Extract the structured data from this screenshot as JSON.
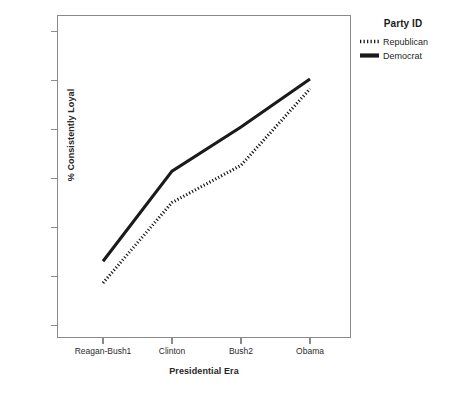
{
  "chart_data": {
    "type": "line",
    "title": "",
    "xlabel": "Presidential Era",
    "ylabel": "% Consistently Loyal",
    "categories": [
      "Reagan-Bush1",
      "Clinton",
      "Bush2",
      "Obama"
    ],
    "series": [
      {
        "name": "Republican",
        "style": "dotted",
        "color": "#1a1a1a",
        "values": [
          59.3,
          67.5,
          71.3,
          79.1
        ]
      },
      {
        "name": "Democrat",
        "style": "solid",
        "color": "#1a1a1a",
        "values": [
          61.5,
          70.7,
          75.2,
          80.1
        ]
      }
    ],
    "ylim": [
      53.2,
      86.8
    ],
    "yticks": [
      85,
      80,
      75,
      70,
      65,
      60,
      55
    ],
    "ytick_labels": [
      "85",
      "80",
      "75",
      "70",
      "65",
      "60",
      "55"
    ],
    "grid": false,
    "legend_position": "right",
    "legend_title": "Party ID",
    "frame_color": "#8a8a8a",
    "background": "#ffffff"
  },
  "legend": {
    "title": "Party ID",
    "entries": [
      {
        "label": "Republican",
        "icon": "dotted-line-swatch"
      },
      {
        "label": "Democrat",
        "icon": "solid-line-swatch"
      }
    ]
  },
  "axes": {
    "y_label": "% Consistently Loyal",
    "x_label": "Presidential Era",
    "y_ticks": [
      "85",
      "80",
      "75",
      "70",
      "65",
      "60",
      "55"
    ],
    "x_ticks": [
      "Reagan-Bush1",
      "Clinton",
      "Bush2",
      "Obama"
    ]
  }
}
